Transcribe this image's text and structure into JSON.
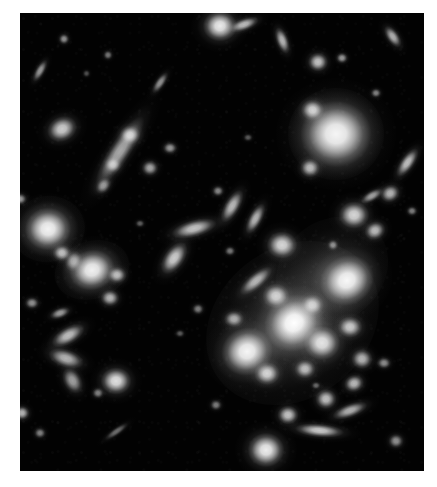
{
  "figure": {
    "kind": "astronomical-deep-field-photograph",
    "palette": {
      "page_background": "#ffffff",
      "sky_background": "#000000",
      "object_core": "#ffffff",
      "object_halo": "#b9b9b9",
      "diffuse_light": "#8c8c8c"
    },
    "plate": {
      "left": 20,
      "top": 13,
      "width": 404,
      "height": 458
    },
    "caption": "",
    "title": ""
  },
  "chart_data": {
    "type": "scatter",
    "title": "",
    "subtitle": "",
    "xlabel": "",
    "ylabel": "",
    "grid": false,
    "legend": null,
    "xlim": [
      0,
      404
    ],
    "ylim": [
      0,
      458
    ],
    "note": "Positions are plate pixel coordinates; size in px; angle in degrees; brightness 0-1.",
    "diffuse_halos": [
      {
        "name": "cluster-intracluster-light-main",
        "x": 272,
        "y": 310,
        "w": 185,
        "h": 150,
        "angle": -38,
        "brightness": 0.5
      },
      {
        "name": "cluster-intracluster-light-upper",
        "x": 312,
        "y": 258,
        "w": 120,
        "h": 100,
        "angle": -40,
        "brightness": 0.34
      },
      {
        "name": "halo-top-right-elliptical",
        "x": 316,
        "y": 121,
        "w": 96,
        "h": 92,
        "angle": 0,
        "brightness": 0.44
      },
      {
        "name": "halo-left-elliptical",
        "x": 28,
        "y": 216,
        "w": 74,
        "h": 66,
        "angle": -10,
        "brightness": 0.4
      },
      {
        "name": "halo-left-lower-elliptical",
        "x": 72,
        "y": 257,
        "w": 76,
        "h": 58,
        "angle": -18,
        "brightness": 0.38
      }
    ],
    "galaxies": [
      {
        "name": "galaxy-bcg-central",
        "x": 274,
        "y": 310,
        "w": 40,
        "h": 36,
        "angle": -35,
        "brightness": 1.0
      },
      {
        "name": "galaxy-cluster-ne",
        "x": 327,
        "y": 268,
        "w": 36,
        "h": 32,
        "angle": -30,
        "brightness": 0.97
      },
      {
        "name": "galaxy-cluster-sw",
        "x": 227,
        "y": 338,
        "w": 34,
        "h": 31,
        "angle": -20,
        "brightness": 0.96
      },
      {
        "name": "galaxy-cluster-se",
        "x": 302,
        "y": 330,
        "w": 24,
        "h": 22,
        "angle": 0,
        "brightness": 0.88
      },
      {
        "name": "galaxy-cluster-core-small-1",
        "x": 256,
        "y": 283,
        "w": 18,
        "h": 16,
        "angle": 0,
        "brightness": 0.8
      },
      {
        "name": "galaxy-cluster-core-small-2",
        "x": 292,
        "y": 292,
        "w": 15,
        "h": 14,
        "angle": 0,
        "brightness": 0.74
      },
      {
        "name": "galaxy-cluster-core-small-3",
        "x": 247,
        "y": 360,
        "w": 17,
        "h": 15,
        "angle": 0,
        "brightness": 0.82
      },
      {
        "name": "galaxy-cluster-core-small-4",
        "x": 285,
        "y": 356,
        "w": 14,
        "h": 12,
        "angle": 0,
        "brightness": 0.72
      },
      {
        "name": "galaxy-cluster-core-small-5",
        "x": 330,
        "y": 314,
        "w": 16,
        "h": 14,
        "angle": 0,
        "brightness": 0.78
      },
      {
        "name": "galaxy-cluster-core-small-6",
        "x": 342,
        "y": 346,
        "w": 14,
        "h": 13,
        "angle": 0,
        "brightness": 0.7
      },
      {
        "name": "galaxy-cluster-core-small-7",
        "x": 214,
        "y": 306,
        "w": 13,
        "h": 11,
        "angle": 0,
        "brightness": 0.66
      },
      {
        "name": "galaxy-cluster-edge-on",
        "x": 236,
        "y": 268,
        "w": 26,
        "h": 10,
        "angle": -40,
        "brightness": 0.7
      },
      {
        "name": "galaxy-cluster-member-n",
        "x": 262,
        "y": 232,
        "w": 20,
        "h": 18,
        "angle": 0,
        "brightness": 0.84
      },
      {
        "name": "galaxy-top-right-giant",
        "x": 316,
        "y": 121,
        "w": 46,
        "h": 43,
        "angle": 0,
        "brightness": 0.95
      },
      {
        "name": "galaxy-top-right-companion",
        "x": 292,
        "y": 97,
        "w": 15,
        "h": 14,
        "angle": 0,
        "brightness": 0.8
      },
      {
        "name": "galaxy-top-right-small",
        "x": 290,
        "y": 155,
        "w": 13,
        "h": 12,
        "angle": 0,
        "brightness": 0.72
      },
      {
        "name": "galaxy-left-elliptical-a",
        "x": 28,
        "y": 216,
        "w": 30,
        "h": 28,
        "angle": 0,
        "brightness": 0.94
      },
      {
        "name": "galaxy-left-elliptical-b",
        "x": 72,
        "y": 257,
        "w": 30,
        "h": 26,
        "angle": -15,
        "brightness": 0.93
      },
      {
        "name": "galaxy-left-companion-a",
        "x": 42,
        "y": 240,
        "w": 12,
        "h": 11,
        "angle": 0,
        "brightness": 0.74
      },
      {
        "name": "galaxy-left-companion-b",
        "x": 97,
        "y": 262,
        "w": 12,
        "h": 11,
        "angle": 0,
        "brightness": 0.72
      },
      {
        "name": "galaxy-left-companion-c",
        "x": 90,
        "y": 285,
        "w": 12,
        "h": 11,
        "angle": 0,
        "brightness": 0.7
      },
      {
        "name": "galaxy-left-nucleus-knot",
        "x": 53,
        "y": 248,
        "w": 11,
        "h": 14,
        "angle": 20,
        "brightness": 0.62
      },
      {
        "name": "galaxy-upper-left-chain",
        "x": 100,
        "y": 138,
        "w": 54,
        "h": 14,
        "angle": -57,
        "brightness": 0.66
      },
      {
        "name": "galaxy-upper-left-knot-1",
        "x": 110,
        "y": 122,
        "w": 14,
        "h": 12,
        "angle": 0,
        "brightness": 0.72
      },
      {
        "name": "galaxy-upper-left-knot-2",
        "x": 93,
        "y": 152,
        "w": 11,
        "h": 10,
        "angle": 0,
        "brightness": 0.6
      },
      {
        "name": "galaxy-upper-left-knot-3",
        "x": 84,
        "y": 173,
        "w": 12,
        "h": 9,
        "angle": -50,
        "brightness": 0.58
      },
      {
        "name": "galaxy-upper-left-elliptical",
        "x": 42,
        "y": 116,
        "w": 20,
        "h": 16,
        "angle": -25,
        "brightness": 0.8
      },
      {
        "name": "galaxy-top-bright",
        "x": 200,
        "y": 13,
        "w": 22,
        "h": 20,
        "angle": 0,
        "brightness": 0.92
      },
      {
        "name": "galaxy-top-edge-on",
        "x": 224,
        "y": 11,
        "w": 20,
        "h": 8,
        "angle": -20,
        "brightness": 0.72
      },
      {
        "name": "galaxy-top-right-streak",
        "x": 262,
        "y": 27,
        "w": 18,
        "h": 8,
        "angle": 70,
        "brightness": 0.7
      },
      {
        "name": "galaxy-top-far-right",
        "x": 373,
        "y": 23,
        "w": 16,
        "h": 8,
        "angle": 55,
        "brightness": 0.68
      },
      {
        "name": "galaxy-top-dot-1",
        "x": 44,
        "y": 26,
        "w": 7,
        "h": 7,
        "angle": 0,
        "brightness": 0.55
      },
      {
        "name": "galaxy-top-dot-2",
        "x": 88,
        "y": 42,
        "w": 6,
        "h": 6,
        "angle": 0,
        "brightness": 0.45
      },
      {
        "name": "galaxy-top-streak-left",
        "x": 20,
        "y": 58,
        "w": 16,
        "h": 6,
        "angle": -60,
        "brightness": 0.58
      },
      {
        "name": "galaxy-upper-mid-streak",
        "x": 140,
        "y": 70,
        "w": 16,
        "h": 6,
        "angle": -55,
        "brightness": 0.56
      },
      {
        "name": "galaxy-upper-right-dot-1",
        "x": 298,
        "y": 49,
        "w": 13,
        "h": 12,
        "angle": 0,
        "brightness": 0.76
      },
      {
        "name": "galaxy-upper-right-dot-2",
        "x": 322,
        "y": 45,
        "w": 8,
        "h": 7,
        "angle": 0,
        "brightness": 0.58
      },
      {
        "name": "galaxy-upper-right-dot-3",
        "x": 356,
        "y": 80,
        "w": 7,
        "h": 6,
        "angle": 0,
        "brightness": 0.5
      },
      {
        "name": "galaxy-mid-right-edge-on",
        "x": 388,
        "y": 150,
        "w": 22,
        "h": 9,
        "angle": -55,
        "brightness": 0.74
      },
      {
        "name": "galaxy-mid-right-dot",
        "x": 370,
        "y": 180,
        "w": 13,
        "h": 11,
        "angle": -30,
        "brightness": 0.7
      },
      {
        "name": "galaxy-right-elliptical",
        "x": 334,
        "y": 202,
        "w": 20,
        "h": 18,
        "angle": 0,
        "brightness": 0.84
      },
      {
        "name": "galaxy-right-companion",
        "x": 355,
        "y": 218,
        "w": 14,
        "h": 12,
        "angle": -25,
        "brightness": 0.72
      },
      {
        "name": "galaxy-right-streak",
        "x": 352,
        "y": 183,
        "w": 16,
        "h": 7,
        "angle": -30,
        "brightness": 0.62
      },
      {
        "name": "galaxy-right-dot-1",
        "x": 313,
        "y": 232,
        "w": 7,
        "h": 7,
        "angle": 0,
        "brightness": 0.52
      },
      {
        "name": "galaxy-right-dot-2",
        "x": 392,
        "y": 198,
        "w": 7,
        "h": 6,
        "angle": 0,
        "brightness": 0.48
      },
      {
        "name": "galaxy-mid-edge-on-a",
        "x": 174,
        "y": 215,
        "w": 30,
        "h": 11,
        "angle": -15,
        "brightness": 0.76
      },
      {
        "name": "galaxy-mid-edge-on-b",
        "x": 154,
        "y": 245,
        "w": 24,
        "h": 13,
        "angle": -55,
        "brightness": 0.8
      },
      {
        "name": "galaxy-mid-edge-on-c",
        "x": 212,
        "y": 193,
        "w": 24,
        "h": 10,
        "angle": -60,
        "brightness": 0.72
      },
      {
        "name": "galaxy-mid-edge-on-d",
        "x": 236,
        "y": 206,
        "w": 22,
        "h": 9,
        "angle": -62,
        "brightness": 0.7
      },
      {
        "name": "galaxy-mid-dot-1",
        "x": 130,
        "y": 155,
        "w": 11,
        "h": 10,
        "angle": 0,
        "brightness": 0.64
      },
      {
        "name": "galaxy-mid-dot-2",
        "x": 150,
        "y": 135,
        "w": 9,
        "h": 8,
        "angle": 0,
        "brightness": 0.58
      },
      {
        "name": "galaxy-mid-dot-3",
        "x": 198,
        "y": 178,
        "w": 8,
        "h": 7,
        "angle": 0,
        "brightness": 0.52
      },
      {
        "name": "galaxy-mid-dot-4",
        "x": 210,
        "y": 238,
        "w": 7,
        "h": 6,
        "angle": 0,
        "brightness": 0.46
      },
      {
        "name": "galaxy-mid-dot-5",
        "x": 178,
        "y": 296,
        "w": 8,
        "h": 7,
        "angle": 0,
        "brightness": 0.48
      },
      {
        "name": "galaxy-lower-left-arc-a",
        "x": 48,
        "y": 322,
        "w": 24,
        "h": 11,
        "angle": -30,
        "brightness": 0.74
      },
      {
        "name": "galaxy-lower-left-arc-b",
        "x": 46,
        "y": 346,
        "w": 24,
        "h": 12,
        "angle": 18,
        "brightness": 0.7
      },
      {
        "name": "galaxy-lower-left-arc-c",
        "x": 52,
        "y": 368,
        "w": 18,
        "h": 12,
        "angle": 62,
        "brightness": 0.62
      },
      {
        "name": "galaxy-lower-left-knot",
        "x": 40,
        "y": 300,
        "w": 14,
        "h": 7,
        "angle": -20,
        "brightness": 0.6
      },
      {
        "name": "galaxy-lower-left-dot-1",
        "x": 12,
        "y": 290,
        "w": 9,
        "h": 8,
        "angle": 0,
        "brightness": 0.56
      },
      {
        "name": "galaxy-lower-left-dot-2",
        "x": 78,
        "y": 380,
        "w": 8,
        "h": 7,
        "angle": 0,
        "brightness": 0.5
      },
      {
        "name": "galaxy-lower-left-bright",
        "x": 96,
        "y": 368,
        "w": 20,
        "h": 18,
        "angle": 0,
        "brightness": 0.88
      },
      {
        "name": "galaxy-lower-left-dot-3",
        "x": 20,
        "y": 420,
        "w": 8,
        "h": 7,
        "angle": 0,
        "brightness": 0.5
      },
      {
        "name": "galaxy-bottom-bright",
        "x": 246,
        "y": 437,
        "w": 24,
        "h": 22,
        "angle": 0,
        "brightness": 0.93
      },
      {
        "name": "galaxy-bottom-dot",
        "x": 268,
        "y": 402,
        "w": 14,
        "h": 12,
        "angle": 0,
        "brightness": 0.76
      },
      {
        "name": "galaxy-bottom-edge-on",
        "x": 300,
        "y": 418,
        "w": 32,
        "h": 9,
        "angle": 5,
        "brightness": 0.78
      },
      {
        "name": "galaxy-bottom-right-dot-1",
        "x": 306,
        "y": 386,
        "w": 14,
        "h": 13,
        "angle": 0,
        "brightness": 0.74
      },
      {
        "name": "galaxy-bottom-right-dot-2",
        "x": 334,
        "y": 370,
        "w": 13,
        "h": 11,
        "angle": -20,
        "brightness": 0.72
      },
      {
        "name": "galaxy-bottom-right-streak",
        "x": 330,
        "y": 398,
        "w": 24,
        "h": 9,
        "angle": -20,
        "brightness": 0.68
      },
      {
        "name": "galaxy-bottom-right-dot-3",
        "x": 364,
        "y": 350,
        "w": 9,
        "h": 8,
        "angle": 0,
        "brightness": 0.54
      },
      {
        "name": "galaxy-bottom-far-right",
        "x": 376,
        "y": 428,
        "w": 10,
        "h": 9,
        "angle": 0,
        "brightness": 0.56
      },
      {
        "name": "galaxy-bottom-mid-dot",
        "x": 196,
        "y": 392,
        "w": 8,
        "h": 7,
        "angle": 0,
        "brightness": 0.48
      },
      {
        "name": "galaxy-left-edge-dot",
        "x": 2,
        "y": 400,
        "w": 10,
        "h": 9,
        "angle": 0,
        "brightness": 0.7
      },
      {
        "name": "galaxy-left-edge-dot-2",
        "x": 0,
        "y": 186,
        "w": 9,
        "h": 8,
        "angle": 0,
        "brightness": 0.6
      },
      {
        "name": "galaxy-streak-bottom-left",
        "x": 96,
        "y": 418,
        "w": 18,
        "h": 5,
        "angle": -35,
        "brightness": 0.42
      },
      {
        "name": "galaxy-faint-dot-a",
        "x": 120,
        "y": 210,
        "w": 6,
        "h": 5,
        "angle": 0,
        "brightness": 0.36
      },
      {
        "name": "galaxy-faint-dot-b",
        "x": 160,
        "y": 320,
        "w": 6,
        "h": 5,
        "angle": 0,
        "brightness": 0.34
      },
      {
        "name": "galaxy-faint-dot-c",
        "x": 228,
        "y": 124,
        "w": 6,
        "h": 5,
        "angle": 0,
        "brightness": 0.34
      },
      {
        "name": "galaxy-faint-dot-d",
        "x": 296,
        "y": 372,
        "w": 6,
        "h": 5,
        "angle": 0,
        "brightness": 0.38
      },
      {
        "name": "galaxy-faint-dot-e",
        "x": 66,
        "y": 60,
        "w": 5,
        "h": 5,
        "angle": 0,
        "brightness": 0.3
      }
    ]
  }
}
